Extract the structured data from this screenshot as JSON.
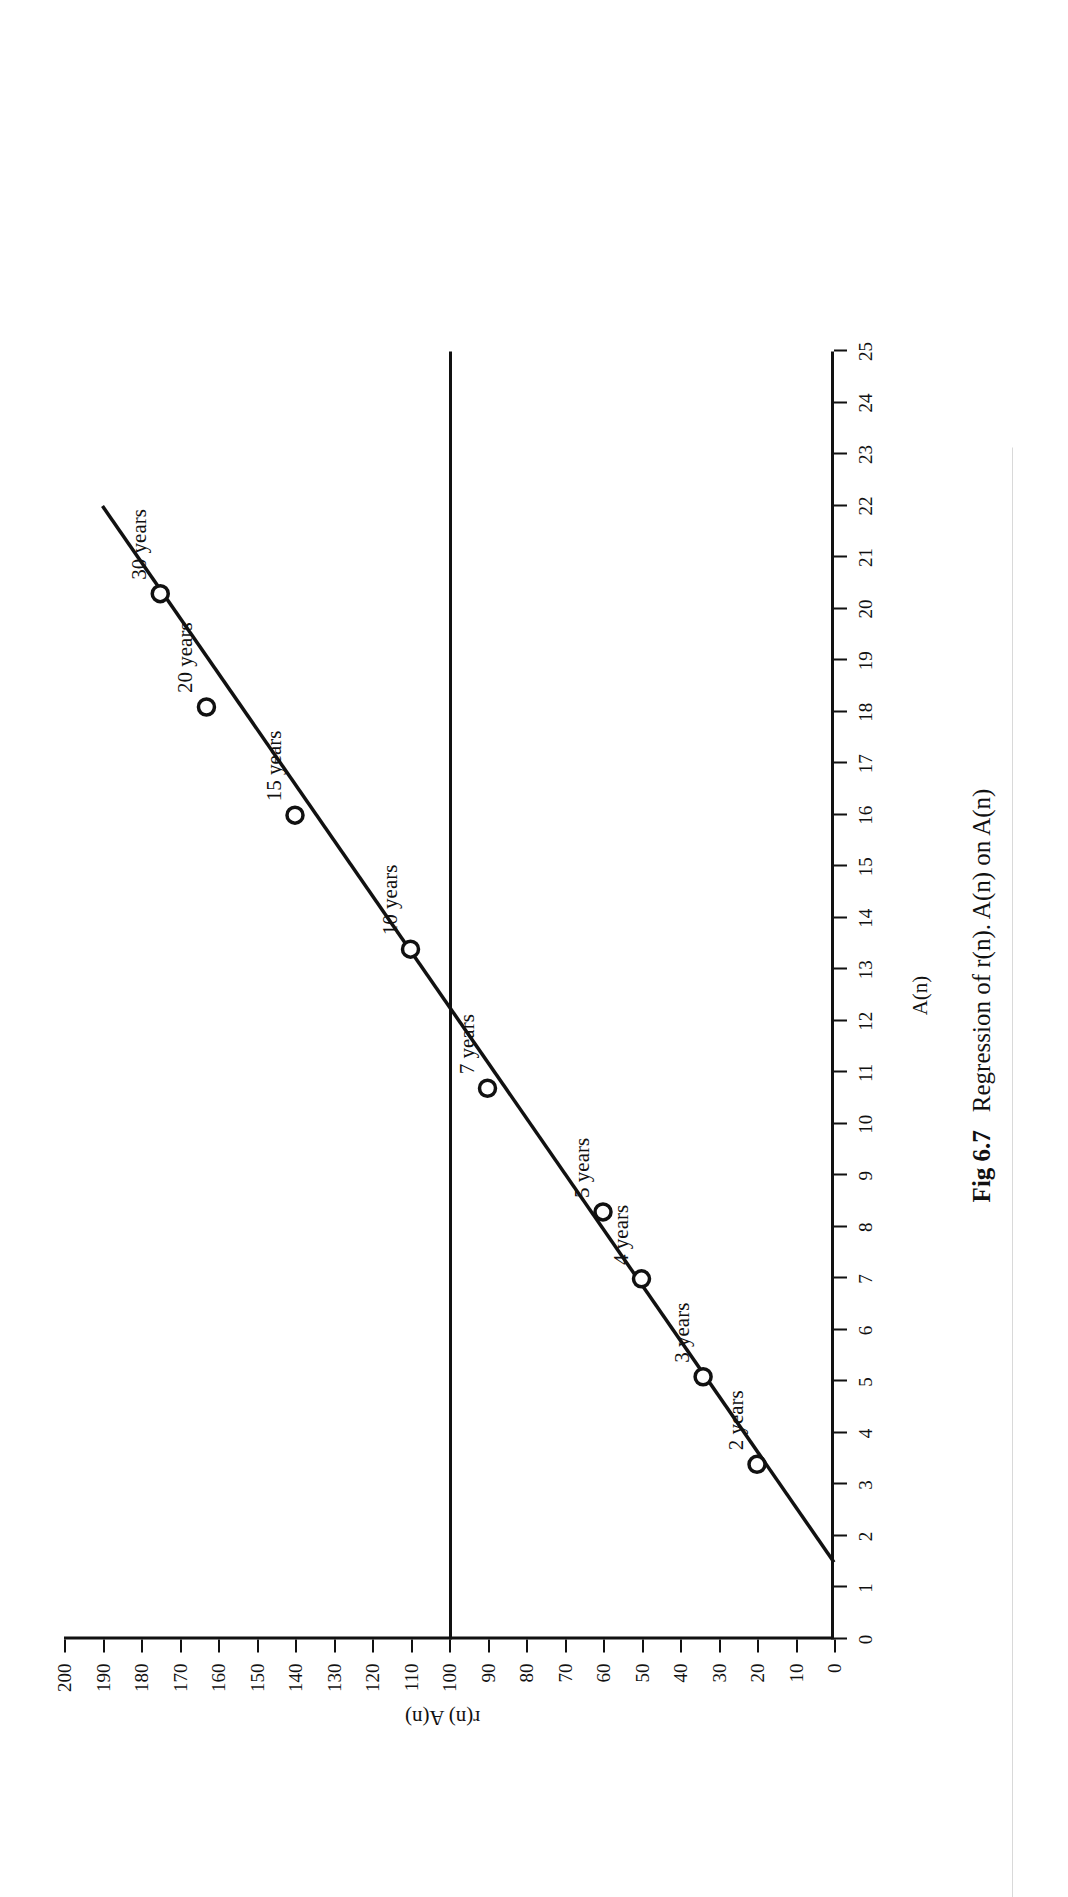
{
  "figure": {
    "number_label": "Fig 6.7",
    "caption_text": "Regression of r(n). A(n) on A(n)",
    "x_axis_title": "A(n)",
    "y_axis_title": "r(n) A(n)"
  },
  "chart_data": {
    "type": "scatter",
    "title": "Regression of r(n). A(n) on A(n)",
    "xlabel": "A(n)",
    "ylabel": "r(n) A(n)",
    "xlim": [
      0,
      25
    ],
    "ylim": [
      0,
      200
    ],
    "x_ticks": [
      0,
      1,
      2,
      3,
      4,
      5,
      6,
      7,
      8,
      9,
      10,
      11,
      12,
      13,
      14,
      15,
      16,
      17,
      18,
      19,
      20,
      21,
      22,
      23,
      24,
      25
    ],
    "y_ticks": [
      0,
      10,
      20,
      30,
      40,
      50,
      60,
      70,
      80,
      90,
      100,
      110,
      120,
      130,
      140,
      150,
      160,
      170,
      180,
      190,
      200
    ],
    "grid": false,
    "legend": null,
    "reference_line": {
      "orientation": "horizontal",
      "y": 100,
      "label": ""
    },
    "fit_line": {
      "x": [
        1.5,
        22.0
      ],
      "y": [
        0,
        190
      ],
      "style": "solid"
    },
    "points": [
      {
        "label": "2 years",
        "x": 3.4,
        "y": 20
      },
      {
        "label": "3 years",
        "x": 5.1,
        "y": 34
      },
      {
        "label": "4 years",
        "x": 7.0,
        "y": 50
      },
      {
        "label": "5 years",
        "x": 8.3,
        "y": 60
      },
      {
        "label": "7 years",
        "x": 10.7,
        "y": 90
      },
      {
        "label": "10 years",
        "x": 13.4,
        "y": 110
      },
      {
        "label": "15 years",
        "x": 16.0,
        "y": 140
      },
      {
        "label": "20 years",
        "x": 18.1,
        "y": 163
      },
      {
        "label": "30 years",
        "x": 20.3,
        "y": 175
      }
    ]
  },
  "colors": {
    "ink": "#111111",
    "paper": "#ffffff"
  }
}
